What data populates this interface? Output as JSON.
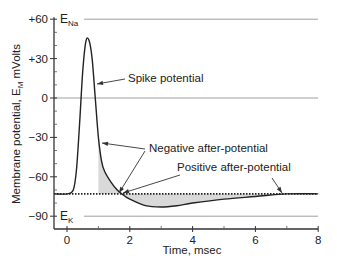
{
  "chart_data": {
    "type": "line",
    "title": "",
    "xlabel": "Time, msec",
    "ylabel": "Membrane potential, E_M mVolts",
    "ylabel_parts": {
      "pre": "Membrane potential, E",
      "sub": "M",
      "post": " mVolts"
    },
    "xlim": [
      -0.5,
      8
    ],
    "ylim": [
      -100,
      60
    ],
    "x_ticks": [
      0,
      2,
      4,
      6,
      8
    ],
    "x_tick_labels": [
      "0",
      "2",
      "4",
      "6",
      "8"
    ],
    "y_ticks": [
      60,
      30,
      0,
      -30,
      -60,
      -90
    ],
    "y_tick_labels": [
      "+60",
      "+30",
      "0",
      "−30",
      "−60",
      "−90"
    ],
    "grid": false,
    "reference_lines": [
      {
        "name": "E_Na",
        "label": "E",
        "sub": "Na",
        "y": 60
      },
      {
        "name": "zero",
        "y": 0
      },
      {
        "name": "E_K",
        "label": "E",
        "sub": "K",
        "y": -90
      },
      {
        "name": "resting potential",
        "y": -73,
        "style": "dotted"
      }
    ],
    "series": [
      {
        "name": "Action potential",
        "x": [
          -0.5,
          0.0,
          0.2,
          0.3,
          0.4,
          0.5,
          0.6,
          0.7,
          0.8,
          0.9,
          1.0,
          1.1,
          1.2,
          1.4,
          1.6,
          1.8,
          2.0,
          2.5,
          3.0,
          3.5,
          4.0,
          5.0,
          6.0,
          7.0,
          8.0
        ],
        "y": [
          -73,
          -73,
          -70,
          -55,
          -20,
          20,
          43,
          44,
          30,
          0,
          -30,
          -48,
          -56,
          -64,
          -70,
          -74,
          -77,
          -82,
          -83,
          -82,
          -80,
          -77,
          -75,
          -73,
          -73
        ]
      }
    ],
    "annotations": [
      {
        "text": "Spike potential",
        "points_to": [
          0.9,
          5
        ]
      },
      {
        "text": "Negative after-potential",
        "points_to": [
          [
            1.1,
            -48
          ],
          [
            1.7,
            -73
          ]
        ]
      },
      {
        "text": "Positive after-potential",
        "points_to": [
          [
            1.8,
            -74
          ],
          [
            6.6,
            -73
          ]
        ]
      }
    ],
    "shaded_regions": [
      {
        "name": "Negative after-potential",
        "x_range": [
          1.0,
          1.7
        ],
        "between": [
          "curve",
          -73
        ]
      },
      {
        "name": "Positive after-potential",
        "x_range": [
          1.7,
          7.0
        ],
        "between": [
          -73,
          "curve"
        ]
      }
    ]
  }
}
